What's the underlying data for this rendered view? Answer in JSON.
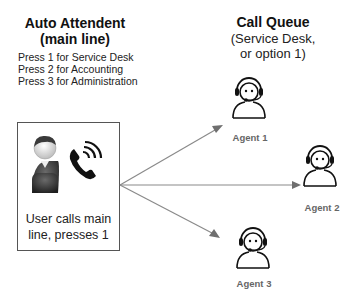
{
  "auto_attendant": {
    "title_line1": "Auto Attendent",
    "title_line2": "(main line)",
    "options": [
      "Press 1 for Service Desk",
      "Press 2 for Accounting",
      "Press 3 for Administration"
    ]
  },
  "caller_box": {
    "line1": "User calls main",
    "line2": "line, presses 1"
  },
  "call_queue": {
    "title": "Call Queue",
    "subtitle_line1": "(Service Desk,",
    "subtitle_line2": "or option 1)"
  },
  "agents": [
    {
      "label": "Agent 1"
    },
    {
      "label": "Agent 2"
    },
    {
      "label": "Agent 3"
    }
  ],
  "colors": {
    "arrow": "#808080",
    "box_border": "#555555",
    "agent_label": "#666666"
  }
}
